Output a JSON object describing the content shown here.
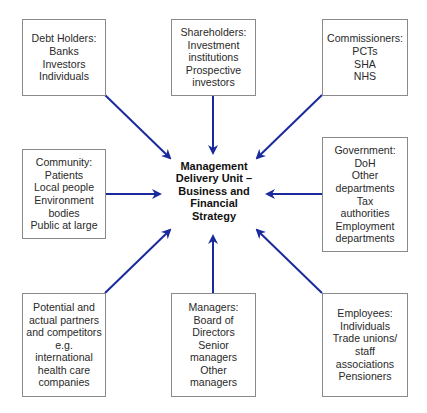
{
  "center": {
    "lines": [
      "Management",
      "Delivery Unit –",
      "Business and",
      "Financial",
      "Strategy"
    ]
  },
  "boxes": {
    "debt_holders": {
      "lines": [
        "Debt Holders:",
        "Banks",
        "Investors",
        "Individuals"
      ]
    },
    "shareholders": {
      "lines": [
        "Shareholders:",
        "Investment",
        "institutions",
        "Prospective",
        "investors"
      ]
    },
    "commissioners": {
      "lines": [
        "Commissioners:",
        "PCTs",
        "SHA",
        "NHS"
      ]
    },
    "community": {
      "lines": [
        "Community:",
        "Patients",
        "Local people",
        "Environment",
        "bodies",
        "Public at large"
      ]
    },
    "government": {
      "lines": [
        "Government:",
        "DoH",
        "Other",
        "departments",
        "Tax",
        "authorities",
        "Employment",
        "departments"
      ]
    },
    "partners": {
      "lines": [
        "Potential and",
        "actual partners",
        "and competitors",
        "e.g.",
        "international",
        "health care",
        "companies"
      ]
    },
    "managers": {
      "lines": [
        "Managers:",
        "Board of",
        "Directors",
        "Senior",
        "managers",
        "Other",
        "managers"
      ]
    },
    "employees": {
      "lines": [
        "Employees:",
        "Individuals",
        "Trade unions/",
        "staff",
        "associations",
        "Pensioners"
      ]
    }
  },
  "colors": {
    "arrow": "#1a2a9c",
    "box_border": "#8a8a8a",
    "text": "#2a2a2a"
  }
}
